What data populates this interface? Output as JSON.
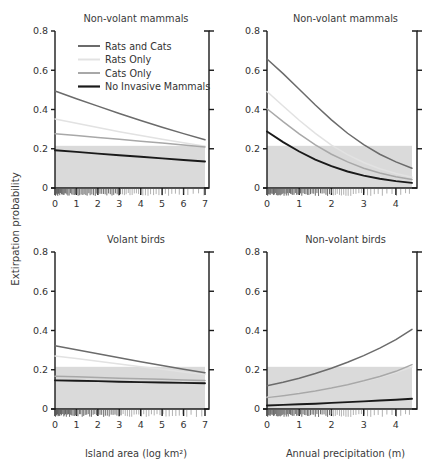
{
  "figure": {
    "y_axis_label": "Extirpation probability",
    "background": "#ffffff",
    "band_color": "#cfcfcf",
    "band_range": [
      0,
      0.215
    ]
  },
  "legend": {
    "position": "top-left-panel",
    "entries": [
      {
        "label": "Rats and Cats",
        "color": "#6b6b6b",
        "width": 2.0
      },
      {
        "label": "Rats Only",
        "color": "#e2e2e2",
        "width": 2.0
      },
      {
        "label": "Cats Only",
        "color": "#a8a8a8",
        "width": 2.0
      },
      {
        "label": "No Invasive Mammals",
        "color": "#1a1a1a",
        "width": 2.2
      }
    ]
  },
  "chart_data": [
    {
      "id": "panel-top-left",
      "type": "line",
      "title": "Non-volant mammals",
      "xlabel": "Island area (log km²)",
      "ylabel": "Extirpation probability",
      "xlim": [
        0,
        7
      ],
      "ylim": [
        0,
        0.8
      ],
      "xticks": [
        0,
        1,
        2,
        3,
        4,
        5,
        6,
        7
      ],
      "yticks": [
        0,
        0.2,
        0.4,
        0.6,
        0.8
      ],
      "ytick_labels": [
        "0",
        "0.2",
        "0.4",
        "0.6",
        "0.8"
      ],
      "grid": false,
      "shaded_band": [
        0,
        0.215
      ],
      "series": [
        {
          "name": "Rats and Cats",
          "color": "#6b6b6b",
          "x": [
            0,
            1,
            2,
            3,
            4,
            5,
            6,
            7
          ],
          "values": [
            0.494,
            0.455,
            0.417,
            0.38,
            0.344,
            0.31,
            0.277,
            0.246
          ]
        },
        {
          "name": "Rats Only",
          "color": "#e2e2e2",
          "x": [
            0,
            1,
            2,
            3,
            4,
            5,
            6,
            7
          ],
          "values": [
            0.352,
            0.33,
            0.308,
            0.287,
            0.267,
            0.248,
            0.23,
            0.213
          ]
        },
        {
          "name": "Cats Only",
          "color": "#a8a8a8",
          "x": [
            0,
            1,
            2,
            3,
            4,
            5,
            6,
            7
          ],
          "values": [
            0.276,
            0.267,
            0.257,
            0.248,
            0.238,
            0.229,
            0.219,
            0.209
          ]
        },
        {
          "name": "No Invasive Mammals",
          "color": "#1a1a1a",
          "x": [
            0,
            1,
            2,
            3,
            4,
            5,
            6,
            7
          ],
          "values": [
            0.192,
            0.184,
            0.175,
            0.167,
            0.159,
            0.151,
            0.143,
            0.135
          ]
        }
      ],
      "rug": [
        0.02,
        0.05,
        0.08,
        0.1,
        0.13,
        0.16,
        0.19,
        0.22,
        0.26,
        0.3,
        0.34,
        0.38,
        0.42,
        0.46,
        0.5,
        0.55,
        0.6,
        0.66,
        0.72,
        0.78,
        0.84,
        0.9,
        0.96,
        1.02,
        1.08,
        1.15,
        1.22,
        1.3,
        1.36,
        1.44,
        1.5,
        1.58,
        1.64,
        1.72,
        1.8,
        1.88,
        1.95,
        2.02,
        2.1,
        2.18,
        2.26,
        2.34,
        2.42,
        2.5,
        2.58,
        2.66,
        2.74,
        2.82,
        2.9,
        2.98,
        3.06,
        3.15,
        3.24,
        3.32,
        3.42,
        3.5,
        3.6,
        3.7,
        3.8,
        3.9,
        4.0,
        4.1,
        4.22,
        4.34,
        4.46,
        4.6,
        4.72,
        4.85,
        5.0,
        5.15,
        5.3,
        5.45,
        5.62,
        5.8,
        6.0,
        6.2,
        6.45,
        6.7,
        6.95
      ]
    },
    {
      "id": "panel-top-right",
      "type": "line",
      "title": "Non-volant mammals",
      "xlabel": "Annual precipitation (m)",
      "ylabel": "Extirpation probability",
      "xlim": [
        0,
        4.5
      ],
      "ylim": [
        0,
        0.8
      ],
      "xticks": [
        0,
        1,
        2,
        3,
        4
      ],
      "yticks": [
        0,
        0.2,
        0.4,
        0.6,
        0.8
      ],
      "ytick_labels": [
        "0",
        "0.2",
        "0.4",
        "0.6",
        "0.8"
      ],
      "grid": false,
      "shaded_band": [
        0,
        0.215
      ],
      "series": [
        {
          "name": "Rats and Cats",
          "color": "#6b6b6b",
          "x": [
            0,
            0.5,
            1,
            1.5,
            2,
            2.5,
            3,
            3.5,
            4,
            4.5
          ],
          "values": [
            0.657,
            0.583,
            0.503,
            0.423,
            0.347,
            0.279,
            0.221,
            0.172,
            0.133,
            0.101
          ]
        },
        {
          "name": "Rats Only",
          "color": "#e2e2e2",
          "x": [
            0,
            0.5,
            1,
            1.5,
            2,
            2.5,
            3,
            3.5,
            4,
            4.5
          ],
          "values": [
            0.492,
            0.418,
            0.345,
            0.278,
            0.219,
            0.17,
            0.13,
            0.098,
            0.074,
            0.055
          ]
        },
        {
          "name": "Cats Only",
          "color": "#a8a8a8",
          "x": [
            0,
            0.5,
            1,
            1.5,
            2,
            2.5,
            3,
            3.5,
            4,
            4.5
          ],
          "values": [
            0.404,
            0.338,
            0.276,
            0.22,
            0.172,
            0.133,
            0.101,
            0.076,
            0.057,
            0.043
          ]
        },
        {
          "name": "No Invasive Mammals",
          "color": "#1a1a1a",
          "x": [
            0,
            0.5,
            1,
            1.5,
            2,
            2.5,
            3,
            3.5,
            4,
            4.5
          ],
          "values": [
            0.288,
            0.234,
            0.186,
            0.145,
            0.111,
            0.084,
            0.063,
            0.047,
            0.035,
            0.026
          ]
        }
      ],
      "rug": [
        0.02,
        0.05,
        0.07,
        0.1,
        0.12,
        0.15,
        0.18,
        0.2,
        0.23,
        0.26,
        0.29,
        0.32,
        0.35,
        0.38,
        0.41,
        0.44,
        0.47,
        0.5,
        0.53,
        0.56,
        0.6,
        0.63,
        0.66,
        0.7,
        0.73,
        0.77,
        0.8,
        0.84,
        0.88,
        0.92,
        0.96,
        1.0,
        1.04,
        1.08,
        1.12,
        1.17,
        1.21,
        1.26,
        1.3,
        1.35,
        1.4,
        1.45,
        1.5,
        1.55,
        1.6,
        1.66,
        1.71,
        1.77,
        1.83,
        1.88,
        1.94,
        2.0,
        2.06,
        2.12,
        2.18,
        2.25,
        2.31,
        2.38,
        2.45,
        2.52,
        2.6,
        2.68,
        2.76,
        2.85,
        2.93,
        3.02,
        3.12,
        3.22,
        3.33,
        3.45,
        3.58,
        3.72,
        3.88,
        4.02,
        4.15,
        4.3,
        4.42
      ]
    },
    {
      "id": "panel-bottom-left",
      "type": "line",
      "title": "Volant birds",
      "xlabel": "Island area (log km²)",
      "ylabel": "Extirpation probability",
      "xlim": [
        0,
        7
      ],
      "ylim": [
        0,
        0.8
      ],
      "xticks": [
        0,
        1,
        2,
        3,
        4,
        5,
        6,
        7
      ],
      "yticks": [
        0,
        0.2,
        0.4,
        0.6,
        0.8
      ],
      "ytick_labels": [
        "0",
        "0.2",
        "0.4",
        "0.6",
        "0.8"
      ],
      "grid": false,
      "shaded_band": [
        0,
        0.215
      ],
      "series": [
        {
          "name": "Rats and Cats",
          "color": "#6b6b6b",
          "x": [
            0,
            1,
            2,
            3,
            4,
            5,
            6,
            7
          ],
          "values": [
            0.322,
            0.302,
            0.281,
            0.261,
            0.241,
            0.222,
            0.203,
            0.185
          ]
        },
        {
          "name": "Rats Only",
          "color": "#e2e2e2",
          "x": [
            0,
            1,
            2,
            3,
            4,
            5,
            6,
            7
          ],
          "values": [
            0.27,
            0.257,
            0.243,
            0.229,
            0.215,
            0.202,
            0.189,
            0.176
          ]
        },
        {
          "name": "Cats Only",
          "color": "#a8a8a8",
          "x": [
            0,
            1,
            2,
            3,
            4,
            5,
            6,
            7
          ],
          "values": [
            0.167,
            0.164,
            0.161,
            0.157,
            0.154,
            0.151,
            0.148,
            0.145
          ]
        },
        {
          "name": "No Invasive Mammals",
          "color": "#1a1a1a",
          "x": [
            0,
            1,
            2,
            3,
            4,
            5,
            6,
            7
          ],
          "values": [
            0.146,
            0.144,
            0.142,
            0.139,
            0.137,
            0.135,
            0.133,
            0.131
          ]
        }
      ],
      "rug": [
        0.02,
        0.04,
        0.07,
        0.09,
        0.12,
        0.14,
        0.17,
        0.2,
        0.23,
        0.26,
        0.3,
        0.33,
        0.37,
        0.41,
        0.45,
        0.49,
        0.53,
        0.58,
        0.63,
        0.68,
        0.73,
        0.78,
        0.84,
        0.9,
        0.95,
        1.01,
        1.07,
        1.14,
        1.2,
        1.27,
        1.34,
        1.41,
        1.48,
        1.55,
        1.62,
        1.7,
        1.78,
        1.86,
        1.94,
        2.02,
        2.1,
        2.18,
        2.27,
        2.35,
        2.44,
        2.53,
        2.62,
        2.71,
        2.8,
        2.89,
        2.99,
        3.08,
        3.18,
        3.28,
        3.38,
        3.48,
        3.58,
        3.69,
        3.8,
        3.91,
        4.02,
        4.14,
        4.26,
        4.38,
        4.5,
        4.63,
        4.76,
        4.9,
        5.04,
        5.18,
        5.33,
        5.48,
        5.64,
        5.8,
        5.97,
        6.15,
        6.35,
        6.6,
        6.85
      ]
    },
    {
      "id": "panel-bottom-right",
      "type": "line",
      "title": "Non-volant birds",
      "xlabel": "Annual precipitation (m)",
      "ylabel": "Extirpation probability",
      "xlim": [
        0,
        4.5
      ],
      "ylim": [
        0,
        0.8
      ],
      "xticks": [
        0,
        1,
        2,
        3,
        4
      ],
      "yticks": [
        0,
        0.2,
        0.4,
        0.6,
        0.8
      ],
      "ytick_labels": [
        "0",
        "0.2",
        "0.4",
        "0.6",
        "0.8"
      ],
      "grid": false,
      "shaded_band": [
        0,
        0.215
      ],
      "series": [
        {
          "name": "Rats and Cats",
          "color": "#6b6b6b",
          "x": [
            0,
            0.5,
            1,
            1.5,
            2,
            2.5,
            3,
            3.5,
            4,
            4.5
          ],
          "values": [
            0.118,
            0.136,
            0.157,
            0.181,
            0.208,
            0.238,
            0.272,
            0.31,
            0.353,
            0.406
          ]
        },
        {
          "name": "Rats Only",
          "color": "#e2e2e2",
          "x": [
            0,
            0.5,
            1,
            1.5,
            2,
            2.5,
            3,
            3.5,
            4,
            4.5
          ],
          "values": [
            0.06,
            0.069,
            0.08,
            0.092,
            0.106,
            0.122,
            0.141,
            0.162,
            0.186,
            0.214
          ]
        },
        {
          "name": "Cats Only",
          "color": "#a8a8a8",
          "x": [
            0,
            0.5,
            1,
            1.5,
            2,
            2.5,
            3,
            3.5,
            4,
            4.5
          ],
          "values": [
            0.058,
            0.068,
            0.079,
            0.092,
            0.107,
            0.124,
            0.144,
            0.166,
            0.192,
            0.226
          ]
        },
        {
          "name": "No Invasive Mammals",
          "color": "#1a1a1a",
          "x": [
            0,
            0.5,
            1,
            1.5,
            2,
            2.5,
            3,
            3.5,
            4,
            4.5
          ],
          "values": [
            0.018,
            0.021,
            0.024,
            0.027,
            0.031,
            0.035,
            0.039,
            0.043,
            0.047,
            0.052
          ]
        }
      ],
      "rug": [
        0.02,
        0.05,
        0.07,
        0.1,
        0.12,
        0.15,
        0.18,
        0.2,
        0.23,
        0.26,
        0.29,
        0.32,
        0.35,
        0.38,
        0.41,
        0.44,
        0.47,
        0.5,
        0.53,
        0.56,
        0.6,
        0.63,
        0.66,
        0.7,
        0.73,
        0.77,
        0.8,
        0.84,
        0.88,
        0.92,
        0.96,
        1.0,
        1.04,
        1.08,
        1.12,
        1.17,
        1.21,
        1.26,
        1.3,
        1.35,
        1.4,
        1.45,
        1.5,
        1.55,
        1.6,
        1.66,
        1.71,
        1.77,
        1.83,
        1.88,
        1.94,
        2.0,
        2.06,
        2.12,
        2.18,
        2.25,
        2.31,
        2.38,
        2.45,
        2.52,
        2.6,
        2.68,
        2.76,
        2.85,
        2.93,
        3.02,
        3.12,
        3.22,
        3.33,
        3.45,
        3.58,
        3.72,
        3.88,
        4.02,
        4.15,
        4.3,
        4.42
      ]
    }
  ]
}
